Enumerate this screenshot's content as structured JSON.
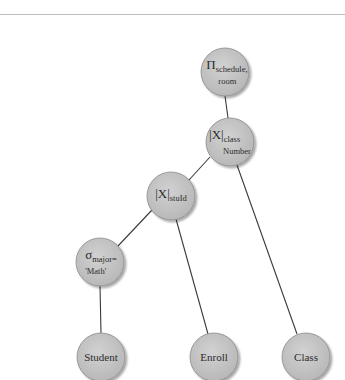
{
  "diagram": {
    "type": "query-tree",
    "title": "",
    "colors": {
      "node_fill": "#c4c4c4",
      "node_stroke": "#8a8a8a",
      "edge": "#3a3a3a",
      "text": "#2b2b2b",
      "rule": "#bdbdbd"
    },
    "nodes": [
      {
        "id": "project",
        "operator": "Π",
        "subscript": "schedule,",
        "subscript2": "room",
        "x": 225,
        "y": 72
      },
      {
        "id": "join-classnumber",
        "operator": "|X|",
        "subscript": "class",
        "subscript2": "Number",
        "x": 230,
        "y": 142
      },
      {
        "id": "join-stuid",
        "operator": "|X|",
        "subscript": "stuId",
        "subscript2": "",
        "x": 171,
        "y": 196
      },
      {
        "id": "select-major",
        "operator": "σ",
        "subscript": "major=",
        "subscript2": "'Math'",
        "x": 100,
        "y": 262
      },
      {
        "id": "student",
        "label": "Student",
        "x": 101,
        "y": 357
      },
      {
        "id": "enroll",
        "label": "Enroll",
        "x": 214,
        "y": 357
      },
      {
        "id": "class",
        "label": "Class",
        "x": 306,
        "y": 357
      }
    ],
    "edges": [
      {
        "from": "project",
        "to": "join-classnumber"
      },
      {
        "from": "join-classnumber",
        "to": "join-stuid"
      },
      {
        "from": "join-classnumber",
        "to": "class"
      },
      {
        "from": "join-stuid",
        "to": "select-major"
      },
      {
        "from": "join-stuid",
        "to": "enroll"
      },
      {
        "from": "select-major",
        "to": "student"
      }
    ],
    "node_radius": 24
  },
  "labels": {
    "project": {
      "op": "Π",
      "sub": "schedule,",
      "sub2": "room"
    },
    "join_classnumber": {
      "op": "|X|",
      "sub": "class",
      "sub2": "Number"
    },
    "join_stuid": {
      "op": "|X|",
      "sub": "stuId"
    },
    "select_major": {
      "op": "σ",
      "sub": "major=",
      "sub2": "'Math'"
    },
    "student": "Student",
    "enroll": "Enroll",
    "class": "Class"
  }
}
